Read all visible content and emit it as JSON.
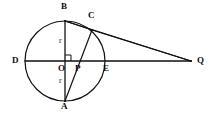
{
  "figure": {
    "kind": "circle-geometry-diagram",
    "width": 212,
    "height": 113,
    "background_color": "#ffffff",
    "stroke_color": "#111111"
  },
  "circle": {
    "name": "main-circle",
    "center_x": 65,
    "center_y": 61,
    "radius": 40,
    "stroke_color": "#111111",
    "stroke_width": 1.2,
    "fill": "none"
  },
  "points": [
    {
      "id": "B",
      "label": "B",
      "x": 65,
      "y": 21,
      "label_x": 61,
      "label_y": 2
    },
    {
      "id": "C",
      "label": "C",
      "x": 92,
      "y": 30,
      "label_x": 88,
      "label_y": 11
    },
    {
      "id": "D",
      "label": "D",
      "x": 25,
      "y": 61,
      "label_x": 12,
      "label_y": 56
    },
    {
      "id": "O",
      "label": "O",
      "x": 65,
      "y": 61,
      "label_x": 58,
      "label_y": 64
    },
    {
      "id": "P",
      "label": "P",
      "x": 80,
      "y": 61,
      "label_x": 75,
      "label_y": 64
    },
    {
      "id": "E",
      "label": "E",
      "x": 105,
      "y": 61,
      "label_x": 103,
      "label_y": 64
    },
    {
      "id": "A",
      "label": "A",
      "x": 65,
      "y": 101,
      "label_x": 61,
      "label_y": 102
    },
    {
      "id": "Q",
      "label": "Q",
      "x": 191,
      "y": 61,
      "label_x": 197,
      "label_y": 56
    }
  ],
  "segments": [
    {
      "id": "chord-BA",
      "name": "segment-b-a",
      "from": "B",
      "to": "A",
      "stroke_width": 1.3
    },
    {
      "id": "diameter-DQ",
      "name": "segment-d-q",
      "from": "D",
      "to": "Q",
      "stroke_width": 1.3
    },
    {
      "id": "chord-BC",
      "name": "segment-b-c",
      "from": "B",
      "to": "C",
      "stroke_width": 1.2
    },
    {
      "id": "secant-BQ",
      "name": "segment-b-q",
      "from": "B",
      "to": "Q",
      "stroke_width": 1.2
    },
    {
      "id": "chord-AC",
      "name": "segment-a-c",
      "from": "A",
      "to": "C",
      "stroke_width": 1.2
    },
    {
      "id": "secant-CQ",
      "name": "segment-c-q",
      "from": "C",
      "to": "Q",
      "stroke_width": 1.2
    }
  ],
  "length_labels": [
    {
      "id": "r-upper",
      "text": "r",
      "x": 59,
      "y": 37
    },
    {
      "id": "r-lower",
      "text": "r",
      "x": 59,
      "y": 77
    }
  ],
  "right_angle": {
    "name": "right-angle-mark-at-o",
    "vertex_x": 65,
    "vertex_y": 61,
    "size": 6,
    "direction": "up-right"
  }
}
